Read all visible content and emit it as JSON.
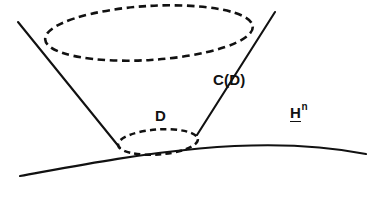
{
  "figure": {
    "background_color": "#ffffff",
    "ink_color": "#111111",
    "labels": {
      "cone": "C(D)",
      "disk": "D",
      "space_base": "H",
      "space_exponent": "n"
    },
    "elements": {
      "top_rim_name": "top dashed ellipse",
      "base_disk_name": "small dashed ellipse",
      "left_ruling_name": "left cone generator line",
      "right_ruling_name": "right cone generator line",
      "manifold_name": "hyperbolic space curve"
    },
    "geometry": {
      "top_ellipse": {
        "cx": 149,
        "cy": 33,
        "rx": 104,
        "ry": 27,
        "rotation_deg": -3.5
      },
      "small_ellipse": {
        "cx": 158,
        "cy": 142,
        "rx": 40,
        "ry": 12.5,
        "rotation_deg": -4
      },
      "left_line": {
        "x1": 18,
        "y1": 22,
        "x2": 120,
        "y2": 148
      },
      "right_line": {
        "x1": 275,
        "y1": 12,
        "x2": 197,
        "y2": 135
      },
      "manifold_curve": {
        "start": [
          20,
          176
        ],
        "control1": [
          120,
          158
        ],
        "control2": [
          250,
          131
        ],
        "end": [
          366,
          154
        ]
      }
    }
  }
}
